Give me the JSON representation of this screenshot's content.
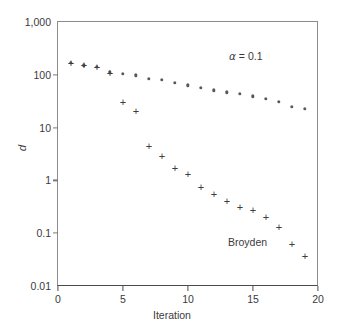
{
  "chart_data": {
    "type": "scatter",
    "title": "",
    "xlabel": "Iteration",
    "ylabel": "d",
    "xlim": [
      0,
      20
    ],
    "ylim": [
      0.01,
      1000
    ],
    "yscale": "log",
    "xscale": "linear",
    "xticks": [
      "0",
      "5",
      "10",
      "15",
      "20"
    ],
    "xtick_values": [
      0,
      5,
      10,
      15,
      20
    ],
    "yticks": [
      "1,000",
      "100",
      "10",
      "1",
      "0.1",
      "0.01"
    ],
    "ytick_values": [
      1000,
      100,
      10,
      1,
      0.1,
      0.01
    ],
    "grid": false,
    "legend_position": "none",
    "annotations": [
      {
        "text": "α = 0.1",
        "symbol": "α",
        "rest": " = 0.1",
        "x": 14.6,
        "y": 330
      },
      {
        "text": "Broyden",
        "x": 14.5,
        "y": 0.11
      }
    ],
    "series": [
      {
        "name": "Steepest descent (alpha = 0.1)",
        "marker": "dot",
        "color": "#58595b",
        "x": [
          1,
          2,
          3,
          4,
          5,
          6,
          7,
          8,
          9,
          10,
          11,
          12,
          13,
          14,
          15,
          16,
          17,
          18,
          19
        ],
        "y": [
          168,
          152,
          140,
          112,
          105,
          98,
          85,
          80,
          71,
          63,
          56,
          51,
          47,
          44,
          39,
          35,
          31,
          25,
          23
        ]
      },
      {
        "name": "Broyden",
        "marker": "plus",
        "color": "#3c3b3d",
        "x": [
          1,
          2,
          3,
          4,
          5,
          6,
          7,
          8,
          9,
          10,
          11,
          12,
          13,
          14,
          15,
          16,
          17,
          18,
          19
        ],
        "y": [
          168,
          152,
          140,
          110,
          30,
          21,
          4.5,
          2.9,
          1.7,
          1.35,
          0.76,
          0.56,
          0.4,
          0.32,
          0.27,
          0.2,
          0.13,
          0.062,
          0.037
        ]
      }
    ]
  }
}
